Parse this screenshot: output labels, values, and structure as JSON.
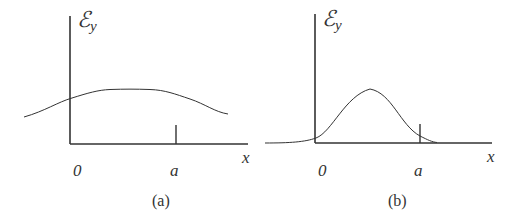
{
  "panels": [
    {
      "caption": "(a)",
      "y_label_main": "ℰ",
      "y_label_sub": "y",
      "x_label": "x",
      "origin_label": "0",
      "tick_label": "a",
      "curve": "broad, flat-topped distribution extending beyond both ends of the interval [0, a]"
    },
    {
      "caption": "(b)",
      "y_label_main": "ℰ",
      "y_label_sub": "y",
      "x_label": "x",
      "origin_label": "0",
      "tick_label": "a",
      "curve": "narrow Gaussian-like peak localized mostly within the interval [0, a]"
    }
  ],
  "colors": {
    "line": "#333333",
    "background": "#ffffff"
  }
}
